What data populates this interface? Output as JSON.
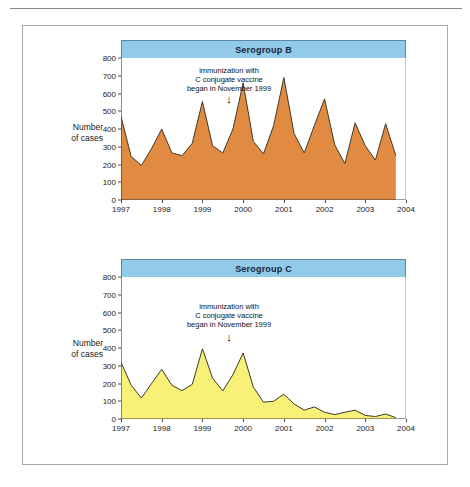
{
  "figure": {
    "annotation_lines": [
      "immunization with",
      "C conjugate vaccine",
      "began in November 1999"
    ],
    "arrow_glyph": "↓",
    "axis_title_line1": "Number",
    "axis_title_line2": "of cases",
    "colors": {
      "banner_fill": "#92cbea",
      "banner_border": "#5d87a6",
      "serogroup_b_fill": "#e08a42",
      "serogroup_c_fill": "#f7f178",
      "line_stroke": "#3f3a28",
      "axis": "#3a3a3a",
      "frame": "#a9a9a9"
    }
  },
  "chart_data": [
    {
      "type": "area",
      "title": "Serogroup B",
      "xlabel": "",
      "ylabel": "Number of cases",
      "xlim": [
        1997,
        2004
      ],
      "ylim": [
        0,
        800
      ],
      "yticks": [
        0,
        100,
        200,
        300,
        400,
        500,
        600,
        700,
        800
      ],
      "xticks": [
        1997,
        1998,
        1999,
        2000,
        2001,
        2002,
        2003,
        2004
      ],
      "grid": false,
      "legend": "none",
      "fill_color": "#e08a42",
      "annotation": "immunization with C conjugate vaccine began in November 1999",
      "annotation_x": 1999.85,
      "x": [
        1997.0,
        1997.25,
        1997.5,
        1997.75,
        1998.0,
        1998.25,
        1998.5,
        1998.75,
        1999.0,
        1999.25,
        1999.5,
        1999.75,
        2000.0,
        2000.25,
        2000.5,
        2000.75,
        2001.0,
        2001.25,
        2001.5,
        2001.75,
        2002.0,
        2002.25,
        2002.5,
        2002.75,
        2003.0,
        2003.25,
        2003.5,
        2003.75
      ],
      "values": [
        470,
        245,
        195,
        290,
        400,
        265,
        250,
        320,
        555,
        305,
        265,
        400,
        660,
        330,
        260,
        420,
        690,
        375,
        265,
        420,
        570,
        310,
        205,
        435,
        305,
        225,
        430,
        250
      ]
    },
    {
      "type": "area",
      "title": "Serogroup C",
      "xlabel": "",
      "ylabel": "Number of cases",
      "xlim": [
        1997,
        2004
      ],
      "ylim": [
        0,
        800
      ],
      "yticks": [
        0,
        100,
        200,
        300,
        400,
        500,
        600,
        700,
        800
      ],
      "xticks": [
        1997,
        1998,
        1999,
        2000,
        2001,
        2002,
        2003,
        2004
      ],
      "grid": false,
      "legend": "none",
      "fill_color": "#f7f178",
      "annotation": "immunization with C conjugate vaccine began in November 1999",
      "annotation_x": 1999.85,
      "x": [
        1997.0,
        1997.25,
        1997.5,
        1997.75,
        1998.0,
        1998.25,
        1998.5,
        1998.75,
        1999.0,
        1999.25,
        1999.5,
        1999.75,
        2000.0,
        2000.25,
        2000.5,
        2000.75,
        2001.0,
        2001.25,
        2001.5,
        2001.75,
        2002.0,
        2002.25,
        2002.5,
        2002.75,
        2003.0,
        2003.25,
        2003.5,
        2003.75
      ],
      "values": [
        320,
        190,
        118,
        200,
        280,
        190,
        160,
        195,
        395,
        230,
        158,
        250,
        372,
        180,
        95,
        100,
        140,
        85,
        50,
        68,
        38,
        25,
        38,
        50,
        20,
        14,
        28,
        8
      ]
    }
  ]
}
